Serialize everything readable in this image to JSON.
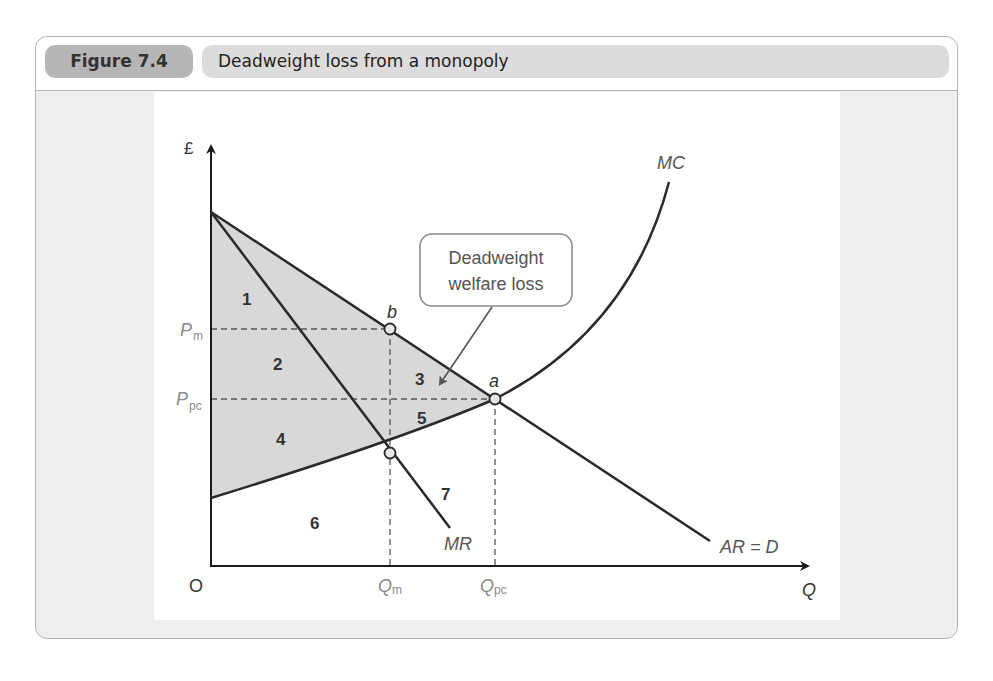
{
  "figure": {
    "number_label": "Figure 7.4",
    "title": "Deadweight loss from a monopoly"
  },
  "axes": {
    "y_label": "£",
    "x_label": "Q",
    "origin_label": "O"
  },
  "ticks": {
    "y": [
      {
        "main": "P",
        "sub": "m"
      },
      {
        "main": "P",
        "sub": "pc"
      }
    ],
    "x": [
      {
        "main": "Q",
        "sub": "m"
      },
      {
        "main": "Q",
        "sub": "pc"
      }
    ]
  },
  "curves": {
    "mc": "MC",
    "mr": "MR",
    "ar": "AR = D"
  },
  "points": {
    "a": "a",
    "b": "b"
  },
  "areas": [
    "1",
    "2",
    "3",
    "4",
    "5",
    "6",
    "7"
  ],
  "callout": {
    "line1": "Deadweight",
    "line2": "welfare loss"
  },
  "colors": {
    "shade": "#d8d8d8",
    "line": "#2a2a2a",
    "tick_text": "#8a8a8a",
    "frame_bg": "#eeeeee",
    "badge": "#b6b6b6",
    "title_bar": "#dcdcdc"
  }
}
